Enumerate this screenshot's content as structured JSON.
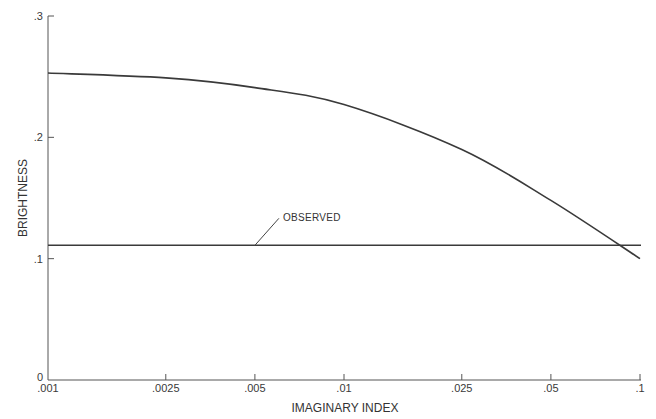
{
  "chart_data": {
    "type": "line",
    "title": "",
    "xlabel": "IMAGINARY INDEX",
    "ylabel": "BRIGHTNESS",
    "xscale": "log",
    "xlim": [
      0.001,
      0.1
    ],
    "ylim": [
      0,
      0.3
    ],
    "grid": false,
    "x_ticks": [
      {
        "value": 0.001,
        "label": ".001"
      },
      {
        "value": 0.0025,
        "label": ".0025"
      },
      {
        "value": 0.005,
        "label": ".005"
      },
      {
        "value": 0.01,
        "label": ".01"
      },
      {
        "value": 0.025,
        "label": ".025"
      },
      {
        "value": 0.05,
        "label": ".05"
      },
      {
        "value": 0.1,
        "label": ".1"
      }
    ],
    "y_ticks": [
      {
        "value": 0,
        "label": "0"
      },
      {
        "value": 0.1,
        "label": ".1"
      },
      {
        "value": 0.2,
        "label": ".2"
      },
      {
        "value": 0.3,
        "label": ".3"
      }
    ],
    "series": [
      {
        "name": "Computed brightness",
        "x": [
          0.001,
          0.0025,
          0.005,
          0.01,
          0.025,
          0.05,
          0.1
        ],
        "values": [
          0.253,
          0.249,
          0.241,
          0.227,
          0.19,
          0.148,
          0.1
        ]
      },
      {
        "name": "OBSERVED",
        "x": [
          0.001,
          0.1
        ],
        "values": [
          0.111,
          0.111
        ]
      }
    ],
    "annotations": [
      {
        "text": "OBSERVED",
        "points_to": {
          "x": 0.005,
          "y": 0.111
        }
      }
    ]
  }
}
